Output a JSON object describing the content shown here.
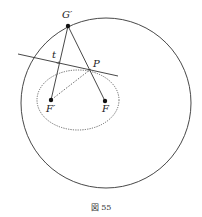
{
  "figure": {
    "caption": "図 55",
    "colors": {
      "stroke": "#333333",
      "point": "#111111",
      "background": "#ffffff"
    },
    "circle": {
      "cx": 106,
      "cy": 103,
      "r": 85
    },
    "ellipse": {
      "cx": 78,
      "cy": 100,
      "rx": 41,
      "ry": 30,
      "style": "dotted"
    },
    "points": {
      "G_prime": {
        "label": "G′",
        "x": 68,
        "y": 26
      },
      "P": {
        "label": "P",
        "x": 91,
        "y": 69
      },
      "F_prime": {
        "label": "F′",
        "x": 51,
        "y": 100
      },
      "F": {
        "label": "F",
        "x": 105,
        "y": 101
      }
    },
    "tangent_line": {
      "label": "t",
      "x1": 18,
      "y1": 54,
      "x2": 118,
      "y2": 76
    },
    "segments": [
      {
        "from": "G_prime",
        "to": "F_prime",
        "style": "solid"
      },
      {
        "from": "G_prime",
        "to": "F",
        "style": "solid"
      },
      {
        "from": "P",
        "to": "F_prime",
        "style": "dashed"
      }
    ]
  }
}
